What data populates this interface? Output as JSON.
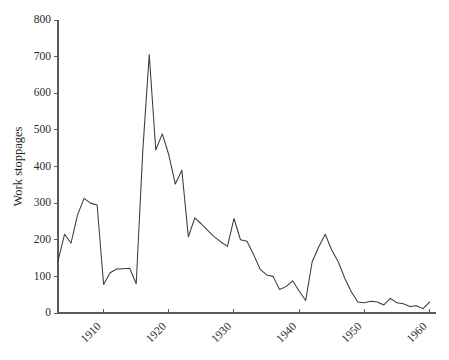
{
  "chart_data": {
    "type": "line",
    "title": "",
    "subtitle": "",
    "xlabel": "",
    "ylabel": "Work stoppages",
    "xlim": [
      1903,
      1961
    ],
    "ylim": [
      0,
      800
    ],
    "grid": false,
    "legend": null,
    "y_ticks": [
      0,
      100,
      200,
      300,
      400,
      500,
      600,
      700,
      800
    ],
    "y_tick_labels": [
      "0",
      "100",
      "200",
      "300",
      "400",
      "500",
      "600",
      "700",
      "800"
    ],
    "x_ticks": [
      1910,
      1920,
      1930,
      1940,
      1950,
      1960
    ],
    "x_tick_labels": [
      "1910",
      "1920",
      "1930",
      "1940",
      "1950",
      "1960"
    ],
    "x_tick_rotation_deg": -45,
    "line_color": "#3b3b3b",
    "axis_color": "#5a5a5a",
    "series": [
      {
        "name": "Work stoppages",
        "x": [
          1903,
          1904,
          1905,
          1906,
          1907,
          1908,
          1909,
          1910,
          1911,
          1912,
          1913,
          1914,
          1915,
          1916,
          1917,
          1918,
          1919,
          1920,
          1921,
          1922,
          1923,
          1924,
          1925,
          1926,
          1927,
          1928,
          1929,
          1930,
          1931,
          1932,
          1933,
          1934,
          1935,
          1936,
          1937,
          1938,
          1939,
          1940,
          1941,
          1942,
          1943,
          1944,
          1945,
          1946,
          1947,
          1948,
          1949,
          1950,
          1951,
          1952,
          1953,
          1954,
          1955,
          1956,
          1957,
          1958,
          1959,
          1960
        ],
        "values": [
          142,
          215,
          191,
          268,
          313,
          300,
          295,
          78,
          110,
          120,
          121,
          122,
          80,
          440,
          706,
          445,
          489,
          432,
          352,
          390,
          208,
          260,
          243,
          225,
          208,
          194,
          182,
          258,
          200,
          196,
          160,
          120,
          104,
          100,
          64,
          72,
          88,
          60,
          34,
          140,
          180,
          215,
          172,
          140,
          95,
          58,
          30,
          28,
          32,
          30,
          22,
          40,
          28,
          25,
          18,
          20,
          12,
          30
        ]
      }
    ]
  },
  "geometry": {
    "plot_left": 58,
    "plot_right": 436,
    "plot_top": 20,
    "plot_bottom": 313
  }
}
